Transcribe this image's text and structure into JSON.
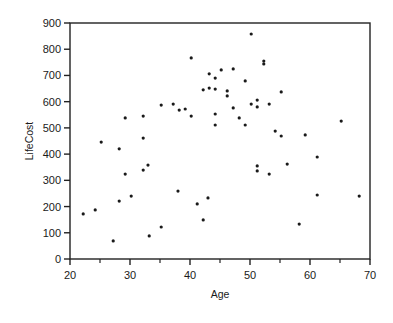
{
  "chart_data": {
    "type": "scatter",
    "title": "",
    "xlabel": "Age",
    "ylabel": "LifeCost",
    "xlim": [
      20,
      70
    ],
    "ylim": [
      0,
      900
    ],
    "x_ticks": [
      20,
      30,
      40,
      50,
      60,
      70
    ],
    "x_minor_ticks": [
      25,
      35,
      45,
      55,
      65
    ],
    "y_ticks": [
      0,
      100,
      200,
      300,
      400,
      500,
      600,
      700,
      800,
      900
    ],
    "grid": false,
    "legend": null,
    "frame": "box",
    "marker_color": "#1a1a1a",
    "series": [
      {
        "name": "LifeCost vs Age",
        "points": [
          [
            22.2,
            172
          ],
          [
            24.2,
            187
          ],
          [
            25.2,
            446
          ],
          [
            27.2,
            69
          ],
          [
            28.2,
            221
          ],
          [
            28.2,
            420
          ],
          [
            29.2,
            538
          ],
          [
            29.2,
            324
          ],
          [
            30.2,
            240
          ],
          [
            32.2,
            545
          ],
          [
            32.2,
            461
          ],
          [
            32.2,
            339
          ],
          [
            33.0,
            358
          ],
          [
            33.2,
            88
          ],
          [
            35.2,
            587
          ],
          [
            35.2,
            122
          ],
          [
            37.2,
            591
          ],
          [
            38.0,
            259
          ],
          [
            38.2,
            568
          ],
          [
            39.2,
            572
          ],
          [
            40.2,
            545
          ],
          [
            40.2,
            767
          ],
          [
            41.2,
            210
          ],
          [
            42.2,
            645
          ],
          [
            42.2,
            149
          ],
          [
            43.0,
            233
          ],
          [
            43.2,
            652
          ],
          [
            43.2,
            706
          ],
          [
            44.2,
            690
          ],
          [
            44.2,
            648
          ],
          [
            44.2,
            553
          ],
          [
            44.2,
            511
          ],
          [
            45.2,
            721
          ],
          [
            46.2,
            641
          ],
          [
            46.2,
            622
          ],
          [
            47.2,
            725
          ],
          [
            47.2,
            576
          ],
          [
            48.2,
            538
          ],
          [
            49.2,
            679
          ],
          [
            49.2,
            511
          ],
          [
            50.2,
            858
          ],
          [
            50.2,
            591
          ],
          [
            51.2,
            606
          ],
          [
            51.2,
            580
          ],
          [
            51.2,
            355
          ],
          [
            51.2,
            336
          ],
          [
            52.3,
            755
          ],
          [
            52.3,
            744
          ],
          [
            53.2,
            591
          ],
          [
            53.2,
            324
          ],
          [
            54.2,
            488
          ],
          [
            55.2,
            637
          ],
          [
            55.2,
            469
          ],
          [
            56.2,
            362
          ],
          [
            58.2,
            133
          ],
          [
            59.2,
            473
          ],
          [
            61.2,
            389
          ],
          [
            61.2,
            244
          ],
          [
            65.2,
            526
          ],
          [
            68.2,
            240
          ]
        ]
      }
    ]
  }
}
